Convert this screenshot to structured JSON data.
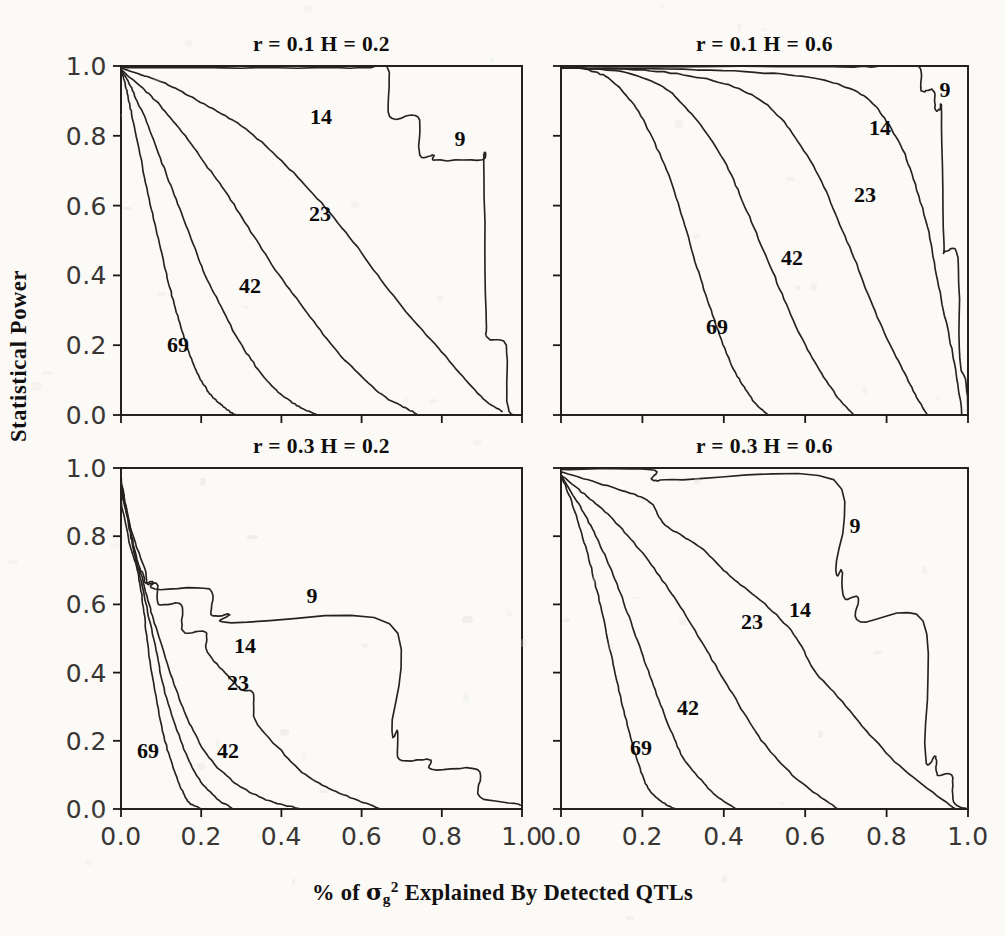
{
  "figure": {
    "y_axis_title": "Statistical Power",
    "x_axis_title_parts": {
      "pre": "% of ",
      "symbol": "σ",
      "sub": "g",
      "sup": "2",
      "post": " Explained By Detected QTLs"
    },
    "x_axis_title_plain": "% of σg2 Explained By Detected QTLs",
    "tick_labels_x": [
      "0.0",
      "0.2",
      "0.4",
      "0.6",
      "0.8",
      "1.0"
    ],
    "tick_labels_y": [
      "0.0",
      "0.2",
      "0.4",
      "0.6",
      "0.8",
      "1.0"
    ],
    "curve_series_names": [
      "9",
      "14",
      "23",
      "42",
      "69"
    ],
    "ink_color": "#262220",
    "paper_color": "#fbfaf7"
  },
  "panels": [
    {
      "id": "top-left",
      "title": "r = 0.1    H = 0.2",
      "r": "0.1",
      "H": "0.2"
    },
    {
      "id": "top-right",
      "title": "r = 0.1    H = 0.6",
      "r": "0.1",
      "H": "0.6"
    },
    {
      "id": "bottom-left",
      "title": "r = 0.3    H = 0.2",
      "r": "0.3",
      "H": "0.2"
    },
    {
      "id": "bottom-right",
      "title": "r = 0.3    H = 0.6",
      "r": "0.3",
      "H": "0.6"
    }
  ],
  "chart_data": {
    "type": "line",
    "xlabel": "% of σg2 Explained By Detected QTLs",
    "ylabel": "Statistical Power",
    "xlim": [
      0.0,
      1.0
    ],
    "ylim": [
      0.0,
      1.0
    ],
    "xticks": [
      0.0,
      0.2,
      0.4,
      0.6,
      0.8,
      1.0
    ],
    "yticks": [
      0.0,
      0.2,
      0.4,
      0.6,
      0.8,
      1.0
    ],
    "grid": false,
    "legend": "inline-curve-labels",
    "panel_grid": {
      "rows": 2,
      "cols": 2
    },
    "panels": [
      {
        "id": "top-left",
        "title": "r = 0.1    H = 0.2",
        "params": {
          "r": 0.1,
          "H": 0.2
        },
        "series": [
          {
            "name": "69",
            "x": [
              0.0,
              0.01,
              0.02,
              0.03,
              0.05,
              0.07,
              0.09,
              0.11,
              0.13,
              0.15,
              0.17,
              0.19,
              0.21,
              0.23,
              0.25,
              0.27,
              0.29
            ],
            "y": [
              0.99,
              0.95,
              0.9,
              0.84,
              0.73,
              0.62,
              0.52,
              0.42,
              0.33,
              0.25,
              0.18,
              0.12,
              0.08,
              0.05,
              0.03,
              0.01,
              0.0
            ]
          },
          {
            "name": "42",
            "x": [
              0.0,
              0.02,
              0.04,
              0.06,
              0.09,
              0.12,
              0.15,
              0.18,
              0.21,
              0.25,
              0.29,
              0.33,
              0.37,
              0.41,
              0.45,
              0.49
            ],
            "y": [
              0.99,
              0.95,
              0.9,
              0.85,
              0.76,
              0.67,
              0.58,
              0.49,
              0.4,
              0.31,
              0.22,
              0.15,
              0.09,
              0.05,
              0.02,
              0.0
            ]
          },
          {
            "name": "23",
            "x": [
              0.0,
              0.03,
              0.07,
              0.11,
              0.16,
              0.21,
              0.26,
              0.31,
              0.36,
              0.42,
              0.48,
              0.54,
              0.6,
              0.66,
              0.71,
              0.74
            ],
            "y": [
              0.99,
              0.96,
              0.92,
              0.87,
              0.8,
              0.72,
              0.64,
              0.55,
              0.46,
              0.36,
              0.27,
              0.18,
              0.11,
              0.05,
              0.02,
              0.0
            ]
          },
          {
            "name": "14",
            "x": [
              0.0,
              0.05,
              0.11,
              0.17,
              0.24,
              0.31,
              0.38,
              0.45,
              0.52,
              0.59,
              0.66,
              0.73,
              0.8,
              0.86,
              0.91,
              0.95
            ],
            "y": [
              0.995,
              0.975,
              0.95,
              0.915,
              0.87,
              0.82,
              0.75,
              0.67,
              0.58,
              0.48,
              0.37,
              0.27,
              0.18,
              0.1,
              0.04,
              0.01
            ]
          },
          {
            "name": "9",
            "x": [
              0.0,
              0.3,
              0.6,
              0.665,
              0.67,
              0.74,
              0.745,
              0.78,
              0.785,
              0.9,
              0.905,
              0.91,
              0.915,
              0.96,
              0.965,
              1.0
            ],
            "y": [
              0.995,
              0.995,
              0.995,
              0.995,
              0.855,
              0.855,
              0.745,
              0.745,
              0.73,
              0.73,
              0.72,
              0.3,
              0.22,
              0.2,
              0.02,
              0.0
            ]
          }
        ]
      },
      {
        "id": "top-right",
        "title": "r = 0.1    H = 0.6",
        "params": {
          "r": 0.1,
          "H": 0.6
        },
        "series": [
          {
            "name": "69",
            "x": [
              0.0,
              0.06,
              0.11,
              0.15,
              0.19,
              0.23,
              0.27,
              0.3,
              0.33,
              0.36,
              0.39,
              0.42,
              0.45,
              0.48,
              0.51
            ],
            "y": [
              0.995,
              0.99,
              0.97,
              0.93,
              0.87,
              0.78,
              0.67,
              0.56,
              0.44,
              0.33,
              0.23,
              0.14,
              0.08,
              0.03,
              0.0
            ]
          },
          {
            "name": "42",
            "x": [
              0.0,
              0.1,
              0.18,
              0.25,
              0.3,
              0.35,
              0.4,
              0.44,
              0.48,
              0.52,
              0.56,
              0.6,
              0.64,
              0.68,
              0.72
            ],
            "y": [
              0.995,
              0.99,
              0.975,
              0.94,
              0.89,
              0.82,
              0.73,
              0.63,
              0.52,
              0.41,
              0.3,
              0.2,
              0.12,
              0.05,
              0.0
            ]
          },
          {
            "name": "23",
            "x": [
              0.0,
              0.18,
              0.3,
              0.4,
              0.48,
              0.54,
              0.59,
              0.64,
              0.68,
              0.72,
              0.76,
              0.8,
              0.84,
              0.87,
              0.9
            ],
            "y": [
              0.995,
              0.99,
              0.975,
              0.95,
              0.91,
              0.85,
              0.77,
              0.67,
              0.56,
              0.45,
              0.33,
              0.22,
              0.13,
              0.06,
              0.0
            ]
          },
          {
            "name": "14",
            "x": [
              0.0,
              0.3,
              0.5,
              0.62,
              0.7,
              0.76,
              0.8,
              0.84,
              0.87,
              0.9,
              0.92,
              0.94,
              0.96,
              0.975,
              0.985
            ],
            "y": [
              0.995,
              0.99,
              0.98,
              0.965,
              0.94,
              0.9,
              0.84,
              0.76,
              0.66,
              0.54,
              0.42,
              0.3,
              0.19,
              0.09,
              0.0
            ]
          },
          {
            "name": "9",
            "x": [
              0.0,
              0.6,
              0.8,
              0.88,
              0.885,
              0.915,
              0.92,
              0.93,
              0.935,
              0.94,
              0.945,
              0.975,
              0.98,
              0.995,
              1.0
            ],
            "y": [
              0.998,
              0.998,
              0.998,
              0.998,
              0.93,
              0.93,
              0.875,
              0.875,
              0.86,
              0.5,
              0.47,
              0.45,
              0.16,
              0.1,
              0.0
            ]
          }
        ]
      },
      {
        "id": "bottom-left",
        "title": "r = 0.3    H = 0.2",
        "params": {
          "r": 0.3,
          "H": 0.2
        },
        "series": [
          {
            "name": "69",
            "x": [
              0.0,
              0.01,
              0.02,
              0.03,
              0.04,
              0.05,
              0.06,
              0.07,
              0.09,
              0.11,
              0.13,
              0.15,
              0.17,
              0.2
            ],
            "y": [
              0.97,
              0.9,
              0.83,
              0.77,
              0.71,
              0.64,
              0.55,
              0.45,
              0.31,
              0.2,
              0.12,
              0.06,
              0.02,
              0.0
            ]
          },
          {
            "name": "42",
            "x": [
              0.0,
              0.01,
              0.02,
              0.03,
              0.04,
              0.05,
              0.07,
              0.09,
              0.11,
              0.14,
              0.17,
              0.2,
              0.24,
              0.28
            ],
            "y": [
              0.96,
              0.9,
              0.84,
              0.78,
              0.72,
              0.67,
              0.56,
              0.45,
              0.34,
              0.23,
              0.14,
              0.08,
              0.03,
              0.0
            ]
          },
          {
            "name": "23",
            "x": [
              0.0,
              0.02,
              0.03,
              0.05,
              0.07,
              0.09,
              0.12,
              0.15,
              0.18,
              0.22,
              0.27,
              0.32,
              0.38,
              0.45
            ],
            "y": [
              0.94,
              0.84,
              0.78,
              0.69,
              0.6,
              0.52,
              0.41,
              0.31,
              0.23,
              0.15,
              0.09,
              0.05,
              0.02,
              0.0
            ]
          },
          {
            "name": "14",
            "x": [
              0.0,
              0.03,
              0.06,
              0.065,
              0.09,
              0.095,
              0.15,
              0.155,
              0.21,
              0.215,
              0.26,
              0.3,
              0.33,
              0.335,
              0.4,
              0.46,
              0.52,
              0.58,
              0.65
            ],
            "y": [
              0.93,
              0.8,
              0.7,
              0.66,
              0.66,
              0.6,
              0.6,
              0.52,
              0.52,
              0.46,
              0.4,
              0.35,
              0.34,
              0.26,
              0.17,
              0.1,
              0.06,
              0.03,
              0.0
            ]
          },
          {
            "name": "9",
            "x": [
              0.0,
              0.03,
              0.055,
              0.06,
              0.08,
              0.085,
              0.22,
              0.225,
              0.27,
              0.275,
              0.67,
              0.675,
              0.69,
              0.695,
              0.77,
              0.775,
              0.89,
              0.895,
              0.99,
              1.0
            ],
            "y": [
              0.9,
              0.74,
              0.69,
              0.665,
              0.665,
              0.645,
              0.645,
              0.57,
              0.57,
              0.545,
              0.545,
              0.23,
              0.23,
              0.145,
              0.145,
              0.115,
              0.115,
              0.035,
              0.015,
              0.0
            ]
          }
        ]
      },
      {
        "id": "bottom-right",
        "title": "r = 0.3    H = 0.6",
        "params": {
          "r": 0.3,
          "H": 0.6
        },
        "series": [
          {
            "name": "69",
            "x": [
              0.0,
              0.02,
              0.04,
              0.06,
              0.08,
              0.1,
              0.12,
              0.14,
              0.16,
              0.18,
              0.2,
              0.22,
              0.25,
              0.28
            ],
            "y": [
              0.98,
              0.92,
              0.85,
              0.77,
              0.68,
              0.58,
              0.47,
              0.36,
              0.26,
              0.17,
              0.1,
              0.05,
              0.02,
              0.0
            ]
          },
          {
            "name": "42",
            "x": [
              0.0,
              0.03,
              0.06,
              0.09,
              0.12,
              0.15,
              0.18,
              0.21,
              0.24,
              0.27,
              0.3,
              0.34,
              0.38,
              0.43
            ],
            "y": [
              0.98,
              0.92,
              0.86,
              0.79,
              0.71,
              0.62,
              0.52,
              0.42,
              0.32,
              0.23,
              0.15,
              0.09,
              0.04,
              0.0
            ]
          },
          {
            "name": "23",
            "x": [
              0.0,
              0.05,
              0.1,
              0.15,
              0.2,
              0.25,
              0.3,
              0.35,
              0.4,
              0.45,
              0.5,
              0.56,
              0.62,
              0.68
            ],
            "y": [
              0.98,
              0.93,
              0.88,
              0.82,
              0.75,
              0.67,
              0.58,
              0.48,
              0.38,
              0.28,
              0.19,
              0.11,
              0.05,
              0.0
            ]
          },
          {
            "name": "14",
            "x": [
              0.0,
              0.08,
              0.16,
              0.22,
              0.25,
              0.3,
              0.35,
              0.4,
              0.45,
              0.52,
              0.58,
              0.62,
              0.68,
              0.75,
              0.82,
              0.9,
              0.97
            ],
            "y": [
              0.99,
              0.96,
              0.93,
              0.9,
              0.84,
              0.8,
              0.76,
              0.7,
              0.65,
              0.58,
              0.5,
              0.41,
              0.33,
              0.23,
              0.14,
              0.06,
              0.0
            ]
          },
          {
            "name": "9",
            "x": [
              0.0,
              0.22,
              0.225,
              0.3,
              0.67,
              0.675,
              0.69,
              0.695,
              0.73,
              0.735,
              0.89,
              0.895,
              0.92,
              0.925,
              0.96,
              0.965,
              1.0
            ],
            "y": [
              0.995,
              0.995,
              0.965,
              0.965,
              0.965,
              0.7,
              0.7,
              0.62,
              0.62,
              0.55,
              0.55,
              0.155,
              0.155,
              0.1,
              0.1,
              0.02,
              0.0
            ]
          }
        ]
      }
    ]
  }
}
